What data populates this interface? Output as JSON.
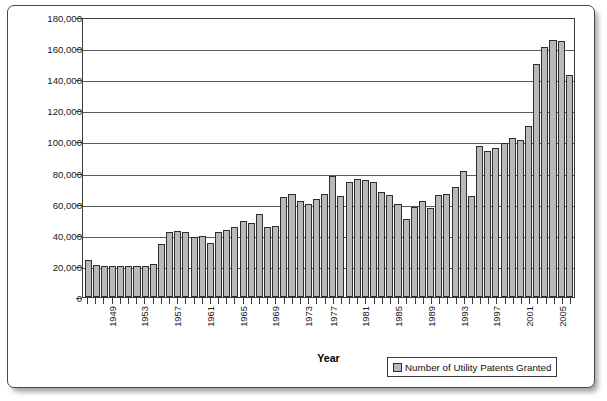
{
  "chart_data": {
    "type": "bar",
    "title": "",
    "xlabel": "Year",
    "ylabel": "",
    "ylim": [
      0,
      180000
    ],
    "ytick_step": 20000,
    "grid": true,
    "legend_position": "bottom-right",
    "series_name": "Number of Utility Patents Granted",
    "bar_fill_color": "#b9b9b9",
    "bar_border_color": "#2e2e2e",
    "ytick_labels": [
      "180,000",
      "160,000",
      "140,000",
      "120,000",
      "100,000",
      "80,000",
      "60,000",
      "40,000",
      "20,000",
      "0"
    ],
    "ytick_values": [
      180000,
      160000,
      140000,
      120000,
      100000,
      80000,
      60000,
      40000,
      20000,
      0
    ],
    "xtick_labels_shown": [
      "1949",
      "1953",
      "1957",
      "1961",
      "1965",
      "1969",
      "1973",
      "1977",
      "1981",
      "1985",
      "1989",
      "1993",
      "1997",
      "2001",
      "2005"
    ],
    "xtick_label_interval": 4,
    "categories": [
      "1946",
      "1947",
      "1948",
      "1949",
      "1950",
      "1951",
      "1952",
      "1953",
      "1954",
      "1955",
      "1956",
      "1957",
      "1958",
      "1959",
      "1960",
      "1961",
      "1962",
      "1963",
      "1964",
      "1965",
      "1966",
      "1967",
      "1968",
      "1969",
      "1970",
      "1971",
      "1972",
      "1973",
      "1974",
      "1975",
      "1977",
      "1978",
      "1979",
      "1980",
      "1981",
      "1982",
      "1983",
      "1984",
      "1985",
      "1986",
      "1987",
      "1988",
      "1989",
      "1990",
      "1991",
      "1992",
      "1993",
      "1994",
      "1995",
      "1996",
      "1997",
      "1998",
      "1999",
      "2000",
      "2001",
      "2002",
      "2003",
      "2004",
      "2005",
      "2006"
    ],
    "values": [
      24000,
      20500,
      20100,
      20000,
      19800,
      20000,
      20000,
      20200,
      21000,
      34000,
      42000,
      42500,
      41500,
      38500,
      39500,
      34500,
      42000,
      43000,
      45000,
      49000,
      47500,
      53500,
      45000,
      45500,
      64500,
      66000,
      62000,
      59500,
      63000,
      66000,
      78000,
      65000,
      74000,
      76000,
      75500,
      74000,
      67500,
      65500,
      60000,
      50000,
      58000,
      61500,
      57000,
      65500,
      66000,
      71000,
      81000,
      65000,
      97000,
      94000,
      95500,
      99000,
      102000,
      101000,
      110000,
      150000,
      161000,
      165000,
      164500,
      143000
    ],
    "peak_value": 165000,
    "final_value": 143000,
    "bar_count": 60
  },
  "legend": {
    "label": "Number of Utility Patents Granted"
  },
  "axes": {
    "x_title": "Year"
  }
}
